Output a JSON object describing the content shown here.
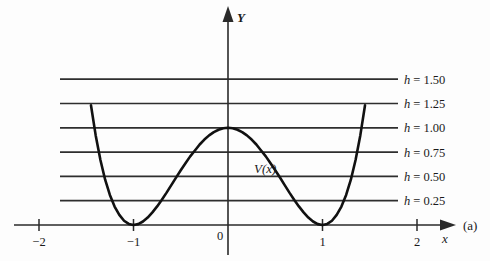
{
  "figure": {
    "panel_label": "(a)",
    "curve_label": "V(x)",
    "y_axis_label": "Y",
    "x_axis_label": "x"
  },
  "chart_data": {
    "type": "line",
    "title": "",
    "subtitle": "",
    "xlabel": "x",
    "ylabel": "Y",
    "xlim": [
      -2.35,
      2.25
    ],
    "ylim": [
      -0.32,
      1.95
    ],
    "grid": false,
    "legend_position": "right",
    "annotations": [
      {
        "text": "V(x)",
        "x": 0.28,
        "y": 0.62
      },
      {
        "text": "(a)",
        "x": 2.18,
        "y": 0.06
      }
    ],
    "x_ticks": [
      -2,
      -1,
      0,
      1,
      2
    ],
    "x_tick_labels": [
      "-2",
      "-1",
      "0",
      "1",
      "2"
    ],
    "y_ticks": [],
    "y_tick_labels": [],
    "series": [
      {
        "name": "V(x)",
        "kind": "curve",
        "formula": "(x^2 - 1)^2",
        "x": [
          -1.45,
          -1.4,
          -1.35,
          -1.3,
          -1.25,
          -1.2,
          -1.15,
          -1.1,
          -1.05,
          -1.0,
          -0.95,
          -0.9,
          -0.85,
          -0.8,
          -0.75,
          -0.7,
          -0.65,
          -0.6,
          -0.55,
          -0.5,
          -0.45,
          -0.4,
          -0.35,
          -0.3,
          -0.25,
          -0.2,
          -0.15,
          -0.1,
          -0.05,
          0.0,
          0.05,
          0.1,
          0.15,
          0.2,
          0.25,
          0.3,
          0.35,
          0.4,
          0.45,
          0.5,
          0.55,
          0.6,
          0.65,
          0.7,
          0.75,
          0.8,
          0.85,
          0.9,
          0.95,
          1.0,
          1.05,
          1.1,
          1.15,
          1.2,
          1.25,
          1.3,
          1.35,
          1.4,
          1.45
        ],
        "y": [
          1.232,
          0.922,
          0.669,
          0.466,
          0.309,
          0.19,
          0.104,
          0.044,
          0.011,
          0.0,
          0.009,
          0.036,
          0.076,
          0.13,
          0.191,
          0.26,
          0.333,
          0.41,
          0.488,
          0.563,
          0.635,
          0.706,
          0.766,
          0.828,
          0.879,
          0.922,
          0.956,
          0.98,
          0.995,
          1.0,
          0.995,
          0.98,
          0.956,
          0.922,
          0.879,
          0.828,
          0.766,
          0.706,
          0.635,
          0.563,
          0.488,
          0.41,
          0.333,
          0.26,
          0.191,
          0.13,
          0.076,
          0.036,
          0.009,
          0.0,
          0.011,
          0.044,
          0.104,
          0.19,
          0.309,
          0.466,
          0.669,
          0.922,
          1.232
        ],
        "peaks": [
          {
            "x": -1.0,
            "y": 1.0
          },
          {
            "x": 1.0,
            "y": 1.0
          }
        ],
        "minima": [
          {
            "x": 0.0,
            "y": 0.0
          }
        ]
      }
    ],
    "level_lines": [
      {
        "label": "h = 1.50",
        "h_symbol": "h",
        "equals": "=",
        "value": "1.50",
        "y": 1.5
      },
      {
        "label": "h = 1.25",
        "h_symbol": "h",
        "equals": "=",
        "value": "1.25",
        "y": 1.25
      },
      {
        "label": "h = 1.00",
        "h_symbol": "h",
        "equals": "=",
        "value": "1.00",
        "y": 1.0
      },
      {
        "label": "h = 0.75",
        "h_symbol": "h",
        "equals": "=",
        "value": "0.75",
        "y": 0.75
      },
      {
        "label": "h = 0.50",
        "h_symbol": "h",
        "equals": "=",
        "value": "0.50",
        "y": 0.5
      },
      {
        "label": "h = 0.25",
        "h_symbol": "h",
        "equals": "=",
        "value": "0.25",
        "y": 0.25
      }
    ],
    "colors": {
      "background": "#fdfdfd",
      "curve": "#111111",
      "axis": "#2a2a2a",
      "level_line": "#2e2e2e",
      "text": "#1a1a1a"
    }
  }
}
